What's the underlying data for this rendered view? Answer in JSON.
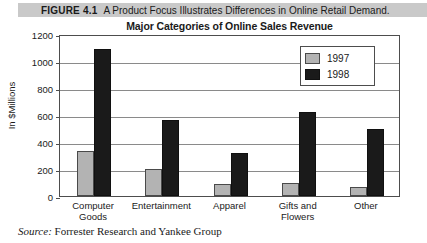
{
  "figure": {
    "label": "FIGURE 4.1",
    "caption": "A Product Focus Illustrates Differences in Online Retail Demand."
  },
  "source": {
    "prefix": "Source:",
    "text": "Forrester Research and Yankee Group"
  },
  "colors": {
    "caption_band": "#c9c9c9",
    "series_1997": "#b3b3b3",
    "series_1998": "#1a1a1a",
    "axis": "#4d4d4d",
    "gridline": "#8a8a8a"
  },
  "chart_data": {
    "type": "bar",
    "title": "Major Categories of Online Sales Revenue",
    "xlabel": "",
    "ylabel": "In $Millions",
    "ylim": [
      0,
      1200
    ],
    "yticks": [
      0,
      200,
      400,
      600,
      800,
      1000,
      1200
    ],
    "ytick_labels": [
      "0",
      "200",
      "400",
      "600",
      "800",
      "1000",
      "1200"
    ],
    "grid": true,
    "legend_position": "top-right",
    "categories": [
      "Computer\nGoods",
      "Entertainment",
      "Apparel",
      "Gifts and\nFlowers",
      "Other"
    ],
    "series": [
      {
        "name": "1997",
        "color": "#b3b3b3",
        "values": [
          330,
          200,
          90,
          100,
          65
        ]
      },
      {
        "name": "1998",
        "color": "#1a1a1a",
        "values": [
          1090,
          560,
          320,
          620,
          500
        ]
      }
    ]
  }
}
